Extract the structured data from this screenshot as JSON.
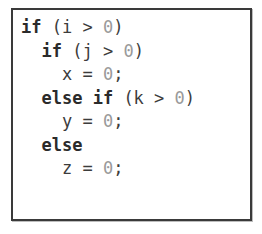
{
  "figure": {
    "kind": "code-listing-figure",
    "language": "C",
    "background_color": "#ffffff",
    "border_color": "#3a3a3a",
    "keyword_color": "#2b2b2b",
    "plain_color": "#3c3c3c",
    "number_color": "#9a9a9a"
  },
  "code": {
    "lines": [
      {
        "indent": "",
        "text": "if (i > 0)",
        "tokens": [
          {
            "t": "if",
            "type": "kw"
          },
          {
            "t": " (i > ",
            "type": "plain"
          },
          {
            "t": "0",
            "type": "num"
          },
          {
            "t": ")",
            "type": "plain"
          }
        ]
      },
      {
        "indent": "  ",
        "text": "  if (j > 0)",
        "tokens": [
          {
            "t": "  ",
            "type": "indent"
          },
          {
            "t": "if",
            "type": "kw"
          },
          {
            "t": " (j > ",
            "type": "plain"
          },
          {
            "t": "0",
            "type": "num"
          },
          {
            "t": ")",
            "type": "plain"
          }
        ]
      },
      {
        "indent": "    ",
        "text": "    x = 0;",
        "tokens": [
          {
            "t": "    ",
            "type": "indent"
          },
          {
            "t": "x = ",
            "type": "plain"
          },
          {
            "t": "0",
            "type": "num"
          },
          {
            "t": ";",
            "type": "plain"
          }
        ]
      },
      {
        "indent": "  ",
        "text": "  else if (k > 0)",
        "tokens": [
          {
            "t": "  ",
            "type": "indent"
          },
          {
            "t": "else if",
            "type": "kw"
          },
          {
            "t": " (k > ",
            "type": "plain"
          },
          {
            "t": "0",
            "type": "num"
          },
          {
            "t": ")",
            "type": "plain"
          }
        ]
      },
      {
        "indent": "    ",
        "text": "    y = 0;",
        "tokens": [
          {
            "t": "    ",
            "type": "indent"
          },
          {
            "t": "y = ",
            "type": "plain"
          },
          {
            "t": "0",
            "type": "num"
          },
          {
            "t": ";",
            "type": "plain"
          }
        ]
      },
      {
        "indent": "  ",
        "text": "  else",
        "tokens": [
          {
            "t": "  ",
            "type": "indent"
          },
          {
            "t": "else",
            "type": "kw"
          }
        ]
      },
      {
        "indent": "    ",
        "text": "    z = 0;",
        "tokens": [
          {
            "t": "    ",
            "type": "indent"
          },
          {
            "t": "z = ",
            "type": "plain"
          },
          {
            "t": "0",
            "type": "num"
          },
          {
            "t": ";",
            "type": "plain"
          }
        ]
      }
    ]
  }
}
